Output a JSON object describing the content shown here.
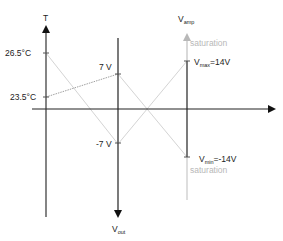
{
  "diagram": {
    "axes": {
      "temperature": {
        "label": "T"
      },
      "vout": {
        "label_main": "V",
        "label_sub": "out"
      },
      "vamp": {
        "label_main": "V",
        "label_sub": "amp"
      }
    },
    "ticks": {
      "t_high": "26.5°C",
      "t_low": "23.5°C",
      "vout_pos": "7 V",
      "vout_neg": "-7 V",
      "vmax_main": "V",
      "vmax_sub": "max",
      "vmax_value": "=14V",
      "vmin_main": "V",
      "vmin_sub": "min",
      "vmin_value": "=-14V"
    },
    "annotations": {
      "saturation_top": "saturation",
      "saturation_bottom": "saturation"
    },
    "colors": {
      "axis": "#222222",
      "mapping_line": "#d0d0d0",
      "saturation": "#b8b8b8",
      "dotted": "#9a9a9a"
    }
  }
}
